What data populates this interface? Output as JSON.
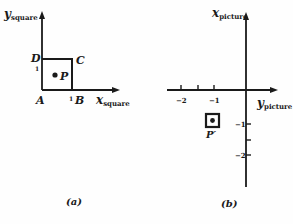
{
  "figure_a": {
    "caption": "(a)",
    "y_axis_label": "y",
    "y_axis_sub": "square",
    "x_axis_label": "x",
    "x_axis_sub": "square",
    "corner_labels": {
      "A": "A",
      "B": "B",
      "C": "C",
      "D": "D"
    },
    "point_label": "P",
    "tick_x": "1",
    "tick_y": "1"
  },
  "figure_b": {
    "caption": "(b)",
    "vertical_axis_label": "x",
    "vertical_axis_sub": "picture",
    "horizontal_axis_label": "y",
    "horizontal_axis_sub": "picture",
    "horizontal_ticks": [
      "−2",
      "−1"
    ],
    "vertical_ticks": [
      "−1",
      "−2"
    ],
    "point_label": "P′"
  },
  "colors": {
    "ink": "#1a1a1a",
    "background": "#fefefe"
  }
}
